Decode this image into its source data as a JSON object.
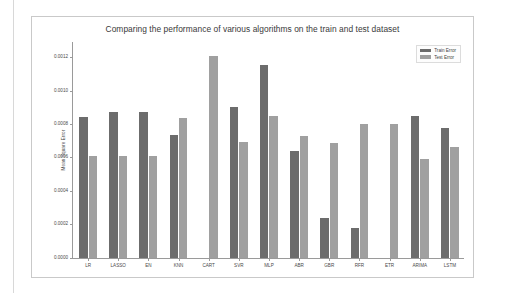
{
  "figure": {
    "title": "Comparing the performance of various algorithms on the train and test dataset",
    "frame_color": "#c9c9c9",
    "background": "#ffffff"
  },
  "legend": {
    "position": "top-right",
    "entries": [
      {
        "label": "Train Error",
        "color": "#6c6c6c"
      },
      {
        "label": "Test Error",
        "color": "#a0a0a0"
      }
    ]
  },
  "axes": {
    "ylabel": "Mean Square Error",
    "xlabel": "",
    "yticks": [
      "0.0000",
      "0.0002",
      "0.0004",
      "0.0006",
      "0.0008",
      "0.0010",
      "0.0012"
    ],
    "ytick_values": [
      0.0,
      0.0002,
      0.0004,
      0.0006,
      0.0008,
      0.001,
      0.0012
    ],
    "ylim": [
      0.0,
      0.0013
    ],
    "grid": false
  },
  "chart_data": {
    "type": "bar",
    "title": "Comparing the performance of various algorithms on the train and test dataset",
    "xlabel": "",
    "ylabel": "Mean Square Error",
    "ylim": [
      0.0,
      0.0013
    ],
    "grid": false,
    "legend_position": "top-right",
    "categories": [
      "LR",
      "LASSO",
      "EN",
      "KNN",
      "CART",
      "SVR",
      "MLP",
      "ABR",
      "GBR",
      "RFR",
      "ETR",
      "ARIMA",
      "LSTM"
    ],
    "series": [
      {
        "name": "Train Error",
        "color": "#6c6c6c",
        "values": [
          0.000845,
          0.000875,
          0.000875,
          0.000735,
          0.0,
          0.000903,
          0.001155,
          0.000641,
          0.000238,
          0.000177,
          0.0,
          0.00085,
          0.000778
        ]
      },
      {
        "name": "Test Error",
        "color": "#a0a0a0",
        "values": [
          0.000612,
          0.000612,
          0.000611,
          0.000836,
          0.001208,
          0.000698,
          0.000852,
          0.000733,
          0.000688,
          0.000804,
          0.000804,
          0.000594,
          0.000663
        ]
      }
    ]
  }
}
